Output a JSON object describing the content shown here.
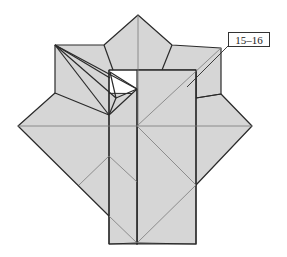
{
  "figure": {
    "type": "origami-folding-diagram",
    "step_label": "15–16",
    "colors": {
      "paper": "#d6d6d6",
      "edge": "#2a2a2a",
      "crease": "#7a7a7a",
      "background": "#ffffff"
    }
  }
}
